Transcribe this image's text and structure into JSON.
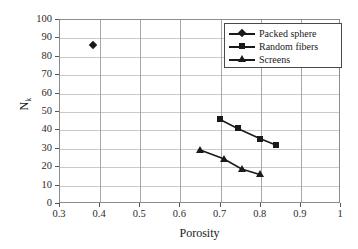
{
  "chart_data": {
    "type": "scatter",
    "title": "",
    "xlabel": "Porosity",
    "ylabel": "N",
    "ylabel_sub": "k",
    "xlim": [
      0.3,
      1
    ],
    "ylim": [
      0,
      100
    ],
    "xticks": [
      "0.3",
      "0.4",
      "0.5",
      "0.6",
      "0.7",
      "0.8",
      "0.9",
      "1"
    ],
    "yticks": [
      "0",
      "10",
      "20",
      "30",
      "40",
      "50",
      "60",
      "70",
      "80",
      "90",
      "100"
    ],
    "grid": "both",
    "legend_position": "top-right",
    "series": [
      {
        "name": "Packed sphere",
        "marker": "diamond",
        "color": "#1a1a1a",
        "x": [
          0.385
        ],
        "y": [
          86
        ]
      },
      {
        "name": "Random fibers",
        "marker": "square",
        "color": "#1a1a1a",
        "x": [
          0.7,
          0.745,
          0.8,
          0.84
        ],
        "y": [
          45.5,
          40.5,
          35.0,
          31.5
        ]
      },
      {
        "name": "Screens",
        "marker": "triangle",
        "color": "#1a1a1a",
        "x": [
          0.65,
          0.71,
          0.755,
          0.8
        ],
        "y": [
          29.0,
          24.0,
          18.5,
          15.5
        ]
      }
    ]
  },
  "legend": {
    "items": [
      {
        "label": "Packed sphere",
        "marker": "diamond"
      },
      {
        "label": "Random fibers",
        "marker": "square"
      },
      {
        "label": "Screens",
        "marker": "triangle"
      }
    ]
  },
  "axes": {
    "x_title": "Porosity",
    "y_title": "N"
  }
}
